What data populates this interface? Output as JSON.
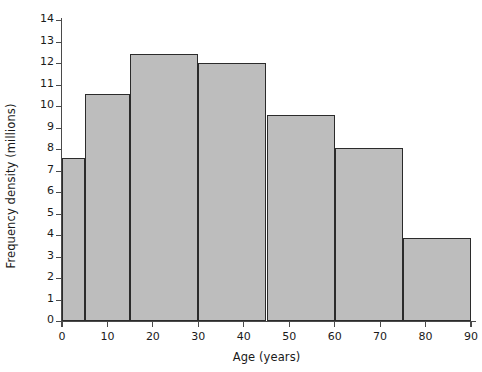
{
  "chart_data": {
    "type": "bar",
    "title": "",
    "subtitle": "",
    "xlabel": "Age (years)",
    "ylabel": "Frequency density (millions)",
    "xlim": [
      0,
      90
    ],
    "ylim": [
      0,
      14
    ],
    "grid": false,
    "legend": null,
    "bar_style": {
      "fill": "#bdbdbd",
      "edge": "#2b2b2b",
      "edge_width_px": 1.6
    },
    "axis_color": "#4a4a4a",
    "text_color": "#1a1a1a",
    "background": "#ffffff",
    "bin_edges": [
      0,
      5,
      15,
      30,
      45,
      60,
      75,
      90
    ],
    "categories": [
      "0-5",
      "5-15",
      "15-30",
      "30-45",
      "45-60",
      "60-75",
      "75-90"
    ],
    "values": [
      7.6,
      10.55,
      12.4,
      12.0,
      9.6,
      8.05,
      3.85
    ],
    "bars": [
      {
        "label": "0-5",
        "x0": 0,
        "x1": 5,
        "height": 7.6
      },
      {
        "label": "5-15",
        "x0": 5,
        "x1": 15,
        "height": 10.55
      },
      {
        "label": "15-30",
        "x0": 15,
        "x1": 30,
        "height": 12.4
      },
      {
        "label": "30-45",
        "x0": 30,
        "x1": 45,
        "height": 12.0
      },
      {
        "label": "45-60",
        "x0": 45,
        "x1": 60,
        "height": 9.6
      },
      {
        "label": "60-75",
        "x0": 60,
        "x1": 75,
        "height": 8.05
      },
      {
        "label": "75-90",
        "x0": 75,
        "x1": 90,
        "height": 3.85
      }
    ],
    "yticks": [
      0,
      1,
      2,
      3,
      4,
      5,
      6,
      7,
      8,
      9,
      10,
      11,
      12,
      13,
      14
    ],
    "ytick_labels": [
      "0",
      "1",
      "2",
      "3",
      "4",
      "5",
      "6",
      "7",
      "8",
      "9",
      "10",
      "11",
      "12",
      "13",
      "14"
    ],
    "xticks": [
      0,
      10,
      20,
      30,
      40,
      50,
      60,
      70,
      80,
      90
    ],
    "xtick_labels": [
      "0",
      "10",
      "20",
      "30",
      "40",
      "50",
      "60",
      "70",
      "80",
      "90"
    ]
  }
}
